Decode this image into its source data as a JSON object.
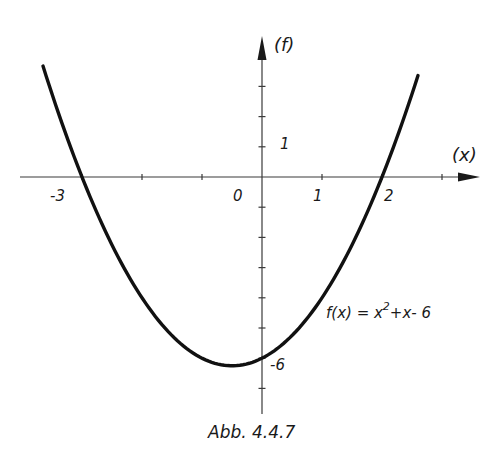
{
  "chart_data": {
    "type": "line",
    "title": "",
    "caption": "Abb. 4.4.7",
    "xlabel": "(x)",
    "ylabel": "(f)",
    "function_label": "f(x) = x²+x-6",
    "function": "x^2 + x - 6",
    "xlim": [
      -3.65,
      2.6
    ],
    "ylim": [
      -7.8,
      4.6
    ],
    "x_ticks": [
      -3,
      -2,
      -1,
      0,
      1,
      2,
      3
    ],
    "y_ticks": [
      -7,
      -6,
      -5,
      -4,
      -3,
      -2,
      -1,
      1,
      2,
      3
    ],
    "tick_labels": {
      "x": [
        {
          "value": -3,
          "label": "-3"
        },
        {
          "value": 0,
          "label": "0"
        },
        {
          "value": 1,
          "label": "1"
        },
        {
          "value": 2,
          "label": "2"
        }
      ],
      "y": [
        {
          "value": 1,
          "label": "1"
        },
        {
          "value": -6,
          "label": "-6"
        }
      ]
    },
    "series": [
      {
        "name": "f(x) = x²+x-6",
        "x": [
          -3.65,
          -3.5,
          -3,
          -2.5,
          -2,
          -1.5,
          -1,
          -0.5,
          0,
          0.5,
          1,
          1.5,
          2,
          2.5,
          2.6
        ],
        "y": [
          3.67,
          2.75,
          0,
          -2.25,
          -4,
          -5.25,
          -6,
          -6.25,
          -6,
          -5.25,
          -4,
          -2.25,
          0,
          2.75,
          3.36
        ]
      }
    ],
    "roots": [
      -3,
      2
    ],
    "y_intercept": -6,
    "vertex": [
      -0.5,
      -6.25
    ],
    "grid": false,
    "legend": "none"
  },
  "labels": {
    "x_axis": "(x)",
    "y_axis": "(f)",
    "origin": "0",
    "x_neg3": "-3",
    "x_1": "1",
    "x_2": "2",
    "y_1": "1",
    "y_neg6": "-6",
    "func_prefix": "f(x) = x",
    "func_exp": "2",
    "func_suffix": "+x- 6",
    "caption": "Abb. 4.4.7"
  }
}
